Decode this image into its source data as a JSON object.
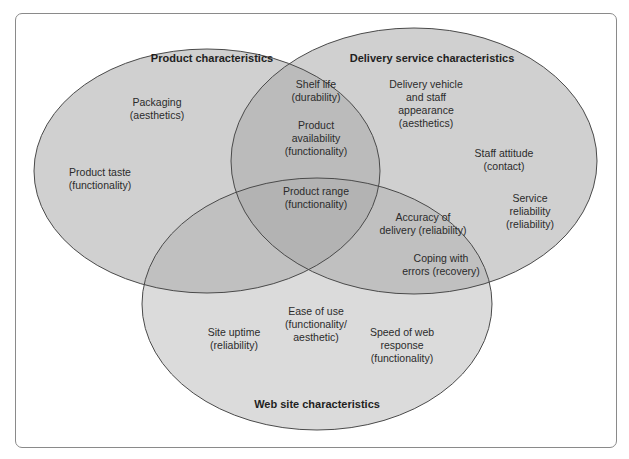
{
  "diagram": {
    "type": "venn",
    "sets": [
      {
        "id": "product",
        "title": "Product characteristics",
        "items": [
          "Packaging\n(aesthetics)",
          "Product taste\n(functionality)"
        ]
      },
      {
        "id": "delivery",
        "title": "Delivery service characteristics",
        "items": [
          "Delivery vehicle\nand staff\nappearance\n(aesthetics)",
          "Staff attitude\n(contact)",
          "Service\nreliability\n(reliability)"
        ]
      },
      {
        "id": "website",
        "title": "Web site characteristics",
        "items": [
          "Site uptime\n(reliability)",
          "Ease of use\n(functionality/\naesthetic)",
          "Speed of web\nresponse\n(functionality)"
        ]
      }
    ],
    "overlaps": {
      "product_delivery": [
        "Shelf life\n(durability)",
        "Product\navailability\n(functionality)"
      ],
      "product_delivery_website": [
        "Product range\n(functionality)"
      ],
      "delivery_website": [
        "Accuracy of\ndelivery (reliability)",
        "Coping with\nerrors (recovery)"
      ]
    },
    "colors": {
      "ellipse_fill": "#b0b0b0",
      "ellipse_stroke": "#4a4a4a",
      "frame_border": "#8a8a8a",
      "text": "#2b2b2b"
    }
  }
}
